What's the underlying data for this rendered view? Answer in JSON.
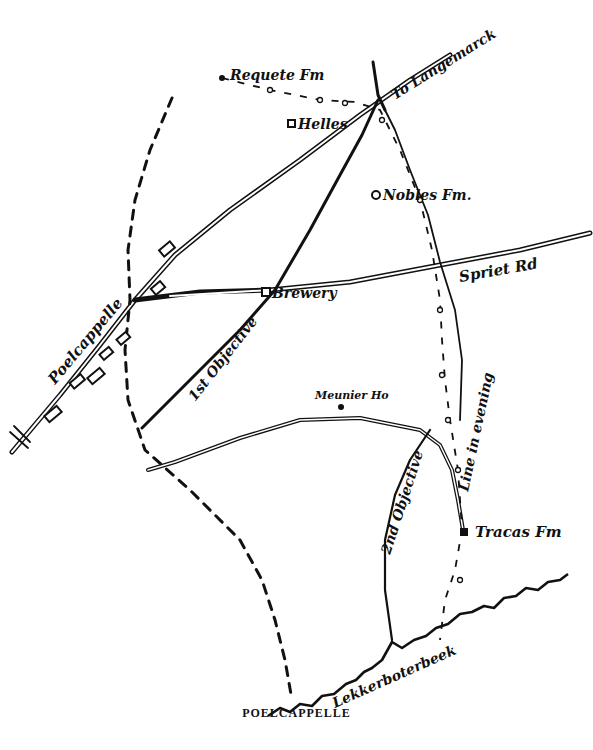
{
  "map": {
    "caption": "POELCAPPELLE",
    "ink_color": "#111111",
    "paper_color": "#ffffff",
    "places": {
      "poelcappelle": "Poelcappelle",
      "requete_farm": "Requete Fm",
      "helles": "Helles",
      "to_langemarck": "To Langemarck",
      "nobles_farm": "Nobles Fm.",
      "spriet_road": "Spriet Rd",
      "brewery": "Brewery",
      "meunier_house": "Meunier Ho",
      "tracas_farm": "Tracas Fm",
      "lekkerboterbeek": "Lekkerboterbeek"
    },
    "lines": {
      "first_objective": "1st Objective",
      "second_objective": "2nd Objective",
      "line_in_evening": "Line in evening"
    },
    "legend_symbols": {
      "road": "double-line",
      "objective": "solid-line",
      "start_line": "dashed-line",
      "evening_line": "dash-dot-circle-line",
      "stream": "wavy-line",
      "farm": "square-marker",
      "ruined_buildings": "hatched-blocks"
    }
  }
}
